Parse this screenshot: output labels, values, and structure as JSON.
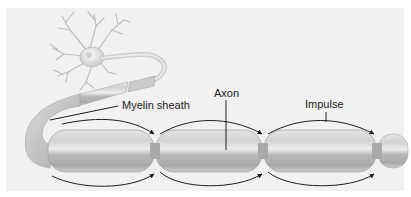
{
  "diagram": {
    "labels": {
      "myelin": "Myelin sheath",
      "axon": "Axon",
      "impulse": "Impulse"
    },
    "colors": {
      "background": "#f1f1f1",
      "sheath_light": "#e6e6e6",
      "sheath_mid": "#c4c4c4",
      "sheath_dark": "#9a9a9a",
      "line": "#1e1e1e"
    }
  }
}
